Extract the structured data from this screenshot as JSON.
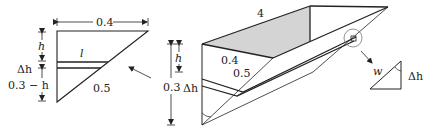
{
  "left_figure": {
    "top_width_label": "0.4",
    "hyp_label": "0.5",
    "strip_length_label": "l",
    "dim_h_label": "h",
    "dim_dh_label": "Δh",
    "dim_rest_label": "0.3 − h"
  },
  "middle_dims": {
    "height_label": "0.3",
    "h_label": "h",
    "dh_label": "Δh"
  },
  "trough": {
    "length_label": "4",
    "side_a_label": "0.4",
    "side_b_label": "0.5",
    "top_face_color": "#d4d4d4"
  },
  "detail_triangle": {
    "width_label": "w",
    "height_label": "Δh"
  }
}
